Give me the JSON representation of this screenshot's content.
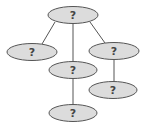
{
  "diagram": {
    "type": "tree",
    "colors": {
      "node_fill": "#dcdcdc",
      "node_stroke": "#555555",
      "edge": "#555555",
      "label": "#444444"
    },
    "nodes": [
      {
        "id": "root",
        "label": "?",
        "cx": 73,
        "cy": 15,
        "rx": 25,
        "ry": 8.5
      },
      {
        "id": "left",
        "label": "?",
        "cx": 32,
        "cy": 52,
        "rx": 25,
        "ry": 8.5
      },
      {
        "id": "middle",
        "label": "?",
        "cx": 73,
        "cy": 70,
        "rx": 24,
        "ry": 8.5
      },
      {
        "id": "right",
        "label": "?",
        "cx": 114,
        "cy": 51,
        "rx": 25,
        "ry": 8.5
      },
      {
        "id": "right-bottom",
        "label": "?",
        "cx": 113,
        "cy": 90,
        "rx": 24,
        "ry": 8.5
      },
      {
        "id": "bottom",
        "label": "?",
        "cx": 73,
        "cy": 113,
        "rx": 24,
        "ry": 8.5
      }
    ],
    "edges": [
      {
        "from": "root",
        "to": "left",
        "x1": 55,
        "y1": 22,
        "x2": 42,
        "y2": 44
      },
      {
        "from": "root",
        "to": "middle",
        "x1": 73,
        "y1": 23,
        "x2": 73,
        "y2": 62
      },
      {
        "from": "root",
        "to": "right",
        "x1": 90,
        "y1": 22,
        "x2": 105,
        "y2": 43
      },
      {
        "from": "middle",
        "to": "bottom",
        "x1": 73,
        "y1": 78,
        "x2": 73,
        "y2": 105
      },
      {
        "from": "right",
        "to": "right-bottom",
        "x1": 114,
        "y1": 59,
        "x2": 114,
        "y2": 82
      }
    ]
  }
}
